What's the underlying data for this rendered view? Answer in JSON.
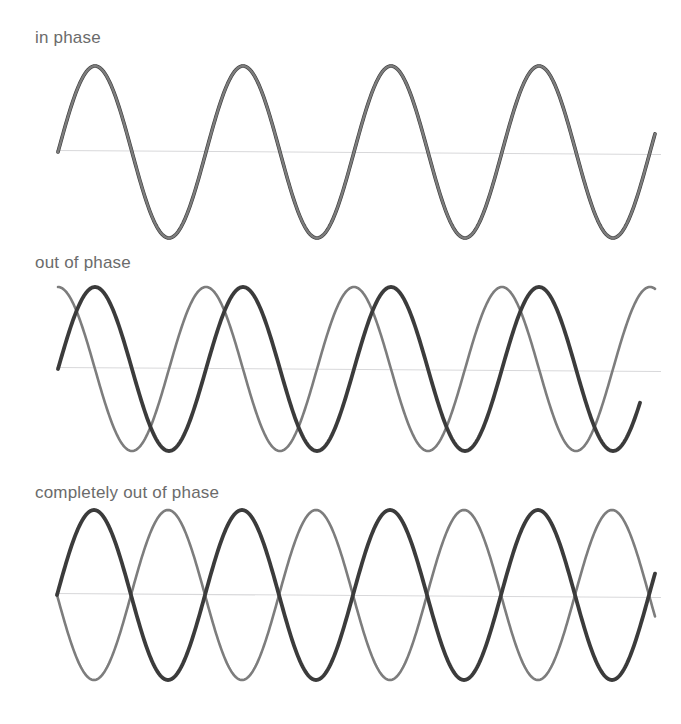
{
  "figure": {
    "background_color": "#ffffff",
    "width": 681,
    "height": 724
  },
  "colors": {
    "wave_dark": "#3b3b3b",
    "wave_gray": "#7d7d7d",
    "baseline": "#d8d8da",
    "label_text": "#6b6b6b"
  },
  "panels": [
    {
      "id": "in-phase",
      "label": "in phase",
      "label_x": 35,
      "label_y": 28,
      "baseline_y": 152,
      "x_start": 58,
      "x_end": 655,
      "amplitude": 86,
      "period": 148,
      "waves": [
        {
          "name": "wave-dark",
          "color": "#3b3b3b",
          "stroke_width": 3.6,
          "phase_deg": 0,
          "amplitude": 86,
          "period": 148,
          "x_start": 58,
          "x_end": 655
        },
        {
          "name": "wave-gray",
          "color": "#7d7d7d",
          "stroke_width": 2.4,
          "phase_deg": 0,
          "amplitude": 86,
          "period": 148,
          "x_start": 58,
          "x_end": 655
        }
      ]
    },
    {
      "id": "out-of-phase",
      "label": "out of phase",
      "label_x": 35,
      "label_y": 253,
      "baseline_y": 369,
      "x_start": 58,
      "x_end": 655,
      "amplitude": 82,
      "period": 148,
      "waves": [
        {
          "name": "wave-gray",
          "color": "#7d7d7d",
          "stroke_width": 2.6,
          "phase_deg": 90,
          "amplitude": 82,
          "period": 148,
          "x_start": 58,
          "x_end": 655
        },
        {
          "name": "wave-dark",
          "color": "#3b3b3b",
          "stroke_width": 3.8,
          "phase_deg": 0,
          "amplitude": 82,
          "period": 148,
          "x_start": 58,
          "x_end": 640
        }
      ]
    },
    {
      "id": "completely-out-of-phase",
      "label": "completely out of phase",
      "label_x": 35,
      "label_y": 483,
      "baseline_y": 595,
      "x_start": 57,
      "x_end": 655,
      "amplitude": 85,
      "period": 148,
      "waves": [
        {
          "name": "wave-gray",
          "color": "#7d7d7d",
          "stroke_width": 2.6,
          "phase_deg": 180,
          "amplitude": 85,
          "period": 148,
          "x_start": 57,
          "x_end": 655
        },
        {
          "name": "wave-dark",
          "color": "#3b3b3b",
          "stroke_width": 3.8,
          "phase_deg": 0,
          "amplitude": 85,
          "period": 148,
          "x_start": 57,
          "x_end": 655
        }
      ]
    }
  ],
  "chart_data": {
    "type": "line",
    "xlabel": "",
    "ylabel": "",
    "grid": false,
    "legend": "none",
    "subplots": [
      {
        "name": "in phase",
        "annotation": "in phase",
        "description": "Two identical sine waves perfectly superimposed; phase difference 0 degrees.",
        "x_range": [
          58,
          655
        ],
        "y_baseline": 152,
        "amplitude": 86,
        "period_px": 148,
        "cycles": 4,
        "series": [
          {
            "name": "wave A (dark)",
            "phase_deg": 0,
            "amplitude": 86,
            "color": "#3b3b3b"
          },
          {
            "name": "wave B (gray)",
            "phase_deg": 0,
            "amplitude": 86,
            "color": "#7d7d7d"
          }
        ]
      },
      {
        "name": "out of phase",
        "annotation": "out of phase",
        "description": "Two sine waves offset by a quarter cycle; phase difference 90 degrees.",
        "x_range": [
          58,
          655
        ],
        "y_baseline": 369,
        "amplitude": 82,
        "period_px": 148,
        "cycles": 4,
        "series": [
          {
            "name": "wave A (dark)",
            "phase_deg": 0,
            "amplitude": 82,
            "color": "#3b3b3b"
          },
          {
            "name": "wave B (gray)",
            "phase_deg": 90,
            "amplitude": 82,
            "color": "#7d7d7d"
          }
        ]
      },
      {
        "name": "completely out of phase",
        "annotation": "completely out of phase",
        "description": "Two sine waves inverted relative to each other; phase difference 180 degrees, producing nodes at every baseline crossing.",
        "x_range": [
          57,
          655
        ],
        "y_baseline": 595,
        "amplitude": 85,
        "period_px": 148,
        "cycles": 4,
        "series": [
          {
            "name": "wave A (dark)",
            "phase_deg": 0,
            "amplitude": 85,
            "color": "#3b3b3b"
          },
          {
            "name": "wave B (gray)",
            "phase_deg": 180,
            "amplitude": 85,
            "color": "#7d7d7d"
          }
        ]
      }
    ]
  }
}
